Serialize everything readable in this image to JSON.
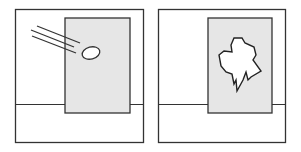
{
  "diagram": {
    "colors": {
      "stroke": "#333333",
      "pane": "#e6e6e6",
      "background": "#ffffff"
    },
    "panels": [
      {
        "id": "before",
        "elements": [
          "frame",
          "window-pane",
          "floor-line",
          "ball",
          "motion-lines"
        ]
      },
      {
        "id": "after",
        "elements": [
          "frame",
          "window-pane",
          "floor-line",
          "broken-hole"
        ]
      }
    ]
  }
}
